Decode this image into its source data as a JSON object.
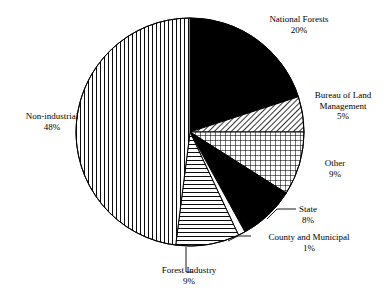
{
  "figure": {
    "background_color": "#ffffff",
    "line_color": "#000000",
    "width": 389,
    "height": 302
  },
  "chart_data": {
    "type": "pie",
    "title": "",
    "subtitle": "",
    "xlabel": "",
    "ylabel": "",
    "legend_position": "none",
    "grid": false,
    "units": "percent",
    "start_angle_deg": 90,
    "direction": "clockwise",
    "center": {
      "x": 190,
      "y": 132
    },
    "radius": 114,
    "categories": [
      "National Forests",
      "Bureau of Land Management",
      "Other",
      "State",
      "County and Municipal",
      "Forest Industry",
      "Non-industrial"
    ],
    "values": [
      20,
      5,
      9,
      8,
      1,
      9,
      48
    ],
    "slices": [
      {
        "label": "National Forests",
        "value": 20,
        "percent_text": "20%",
        "fill": "solid-black",
        "fill_color": "#000000",
        "start_deg": 0,
        "end_deg": 72,
        "label_anchor": "center",
        "has_leader_line": false
      },
      {
        "label": "Bureau of Land Management",
        "label_line1": "Bureau of Land",
        "label_line2": "Management",
        "value": 5,
        "percent_text": "5%",
        "fill": "diagonal-hatch",
        "fill_color": "#000000",
        "start_deg": 72,
        "end_deg": 90,
        "label_anchor": "center",
        "has_leader_line": false
      },
      {
        "label": "Other",
        "value": 9,
        "percent_text": "9%",
        "fill": "cross-hatch-grid",
        "fill_color": "#000000",
        "start_deg": 90,
        "end_deg": 122.4,
        "label_anchor": "center",
        "has_leader_line": false
      },
      {
        "label": "State",
        "value": 8,
        "percent_text": "8%",
        "fill": "solid-black",
        "fill_color": "#000000",
        "start_deg": 122.4,
        "end_deg": 151.2,
        "label_anchor": "center",
        "has_leader_line": true
      },
      {
        "label": "County and Municipal",
        "value": 1,
        "percent_text": "1%",
        "fill": "white",
        "fill_color": "#ffffff",
        "start_deg": 151.2,
        "end_deg": 154.8,
        "label_anchor": "center",
        "has_leader_line": true
      },
      {
        "label": "Forest Industry",
        "value": 9,
        "percent_text": "9%",
        "fill": "horizontal-lines",
        "fill_color": "#000000",
        "start_deg": 154.8,
        "end_deg": 187.2,
        "label_anchor": "center",
        "has_leader_line": true
      },
      {
        "label": "Non-industrial",
        "value": 48,
        "percent_text": "48%",
        "fill": "vertical-lines",
        "fill_color": "#000000",
        "start_deg": 187.2,
        "end_deg": 360,
        "label_anchor": "center",
        "has_leader_line": false
      }
    ]
  },
  "labels": {
    "national_forests": {
      "name": "National Forests",
      "percent": "20%"
    },
    "blm": {
      "line1": "Bureau of Land",
      "line2": "Management",
      "percent": "5%"
    },
    "other": {
      "name": "Other",
      "percent": "9%"
    },
    "state": {
      "name": "State",
      "percent": "8%"
    },
    "county": {
      "name": "County and Municipal",
      "percent": "1%"
    },
    "forest_industry": {
      "name": "Forest Industry",
      "percent": "9%"
    },
    "non_industrial": {
      "name": "Non-industrial",
      "percent": "48%"
    }
  }
}
